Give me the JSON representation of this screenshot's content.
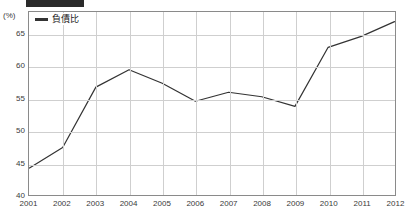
{
  "header_band": {
    "description": "cropped-dark-band",
    "color": "#2a2a2a"
  },
  "chart_data": {
    "type": "line",
    "title": "",
    "subtitle": "",
    "xlabel": "",
    "ylabel": "",
    "y_unit_label": "(%)",
    "categories": [
      "2001",
      "2002",
      "2003",
      "2004",
      "2005",
      "2006",
      "2007",
      "2008",
      "2009",
      "2010",
      "2011",
      "2012"
    ],
    "x": [
      2001,
      2002,
      2003,
      2004,
      2005,
      2006,
      2007,
      2008,
      2009,
      2010,
      2011,
      2012
    ],
    "series": [
      {
        "name": "負債比",
        "color": "#333333",
        "values": [
          44.2,
          47.4,
          56.8,
          59.5,
          57.4,
          54.6,
          56.0,
          55.3,
          53.8,
          63.0,
          64.7,
          67.0
        ]
      }
    ],
    "values": [
      44.2,
      47.4,
      56.8,
      59.5,
      57.4,
      54.6,
      56.0,
      55.3,
      53.8,
      63.0,
      64.7,
      67.0
    ],
    "ylim": [
      40,
      68.5
    ],
    "yticks": [
      40,
      45,
      50,
      55,
      60,
      65
    ],
    "ytick_labels": [
      "40",
      "45",
      "50",
      "55",
      "60",
      "65"
    ],
    "grid": true,
    "grid_horizontal": true,
    "grid_vertical": true,
    "legend_position": "top-left",
    "legend_entries": [
      "負債比"
    ],
    "line_color": "#333333",
    "grid_color": "#cfcfcf",
    "frame_color": "#8a8a8a",
    "background": "#ffffff"
  }
}
